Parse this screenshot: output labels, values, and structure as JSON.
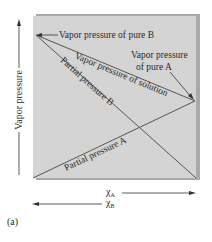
{
  "diagram": {
    "y_axis_label": "Vapor pressure",
    "x_axis_label_a": "χ",
    "x_axis_sub_a": "A",
    "x_axis_label_b": "χ",
    "x_axis_sub_b": "B",
    "panel_label": "(a)",
    "labels": {
      "pure_b": "Vapor pressure of pure B",
      "pure_a_line1": "Vapor pressure",
      "pure_a_line2": "of pure A",
      "solution": "Vapor pressure of solution",
      "partial_b": "Partial pressure B",
      "partial_a": "Partial pressure A"
    },
    "colors": {
      "panel": "#d3d3d3",
      "shadow": "#a9a9a9",
      "line": "#555555"
    }
  }
}
